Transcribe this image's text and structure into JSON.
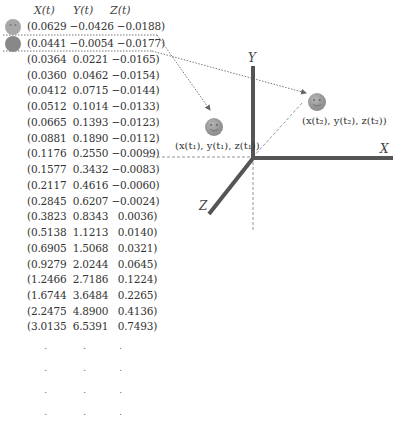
{
  "table": {
    "headers": [
      "X(t)",
      "Y(t)",
      "Z(t)"
    ],
    "rows": [
      "(0.0629 −0.0426 −0.0188)",
      "(0.0441 −0.0054 −0.0177)",
      "(0.0364  0.0221 −0.0165)",
      "(0.0360  0.0462 −0.0154)",
      "(0.0412  0.0715 −0.0144)",
      "(0.0512  0.1014 −0.0133)",
      "(0.0665  0.1393 −0.0123)",
      "(0.0881  0.1890 −0.0112)",
      "(0.1176  0.2550 −0.0099)",
      "(0.1577  0.3432 −0.0083)",
      "(0.2117  0.4616 −0.0060)",
      "(0.2845  0.6207 −0.0024)",
      "(0.3823  0.8343   0.0036)",
      "(0.5138  1.1213   0.0140)",
      "(0.6905  1.5068   0.0321)",
      "(0.9279  2.0244   0.0645)",
      "(1.2466  2.7186   0.1224)",
      "(1.6744  3.6484   0.2265)",
      "(2.2475  4.8900   0.4136)",
      "(3.0135  6.5391   0.7493)"
    ],
    "continuation": "."
  },
  "axes": {
    "x_label": "X",
    "y_label": "Y",
    "z_label": "Z"
  },
  "points": {
    "p1_label": "(x(t₁), y(t₁), z(t₁))",
    "p2_label": "(x(t₂), y(t₂), z(t₂))",
    "icon": "smiley-face-icon"
  },
  "colors": {
    "axis": "#555555",
    "smiley": "#999999",
    "dashed": "#888888"
  }
}
